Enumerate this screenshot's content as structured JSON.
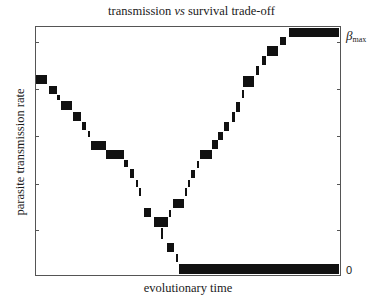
{
  "chart_data": {
    "type": "scatter",
    "title": "transmission vs survival trade-off",
    "title_parts": {
      "pre": "transmission ",
      "italic": "vs",
      "post": " survival trade-off"
    },
    "xlabel": "evolutionary time",
    "ylabel": "parasite transmission rate",
    "right_axis_labels": {
      "top": "β",
      "top_sub": "max",
      "bottom": "0"
    },
    "xlim": [
      0,
      1
    ],
    "ylim": [
      0,
      1
    ],
    "grid": false,
    "legend": null,
    "y_ticks_frac_from_top": [
      0.06,
      0.252,
      0.44,
      0.632,
      0.82
    ],
    "series": [
      {
        "name": "declining-branch",
        "blocks": [
          {
            "x0": 0.0,
            "x1": 0.036,
            "y0": 0.192,
            "y1": 0.228
          },
          {
            "x0": 0.042,
            "x1": 0.069,
            "y0": 0.236,
            "y1": 0.272
          },
          {
            "x0": 0.069,
            "x1": 0.078,
            "y0": 0.276,
            "y1": 0.296
          },
          {
            "x0": 0.082,
            "x1": 0.118,
            "y0": 0.3,
            "y1": 0.336
          },
          {
            "x0": 0.121,
            "x1": 0.147,
            "y0": 0.344,
            "y1": 0.38
          },
          {
            "x0": 0.151,
            "x1": 0.163,
            "y0": 0.384,
            "y1": 0.416
          },
          {
            "x0": 0.17,
            "x1": 0.175,
            "y0": 0.42,
            "y1": 0.444
          },
          {
            "x0": 0.18,
            "x1": 0.229,
            "y0": 0.46,
            "y1": 0.496
          },
          {
            "x0": 0.229,
            "x1": 0.288,
            "y0": 0.496,
            "y1": 0.532
          },
          {
            "x0": 0.291,
            "x1": 0.304,
            "y0": 0.536,
            "y1": 0.564
          },
          {
            "x0": 0.31,
            "x1": 0.324,
            "y0": 0.572,
            "y1": 0.608
          },
          {
            "x0": 0.33,
            "x1": 0.337,
            "y0": 0.616,
            "y1": 0.644
          },
          {
            "x0": 0.34,
            "x1": 0.346,
            "y0": 0.648,
            "y1": 0.68
          },
          {
            "x0": 0.356,
            "x1": 0.379,
            "y0": 0.728,
            "y1": 0.768
          },
          {
            "x0": 0.389,
            "x1": 0.435,
            "y0": 0.768,
            "y1": 0.808
          },
          {
            "x0": 0.412,
            "x1": 0.418,
            "y0": 0.812,
            "y1": 0.856
          },
          {
            "x0": 0.431,
            "x1": 0.454,
            "y0": 0.872,
            "y1": 0.908
          },
          {
            "x0": 0.461,
            "x1": 0.467,
            "y0": 0.916,
            "y1": 0.948
          },
          {
            "x0": 0.471,
            "x1": 0.997,
            "y0": 0.956,
            "y1": 0.996
          }
        ]
      },
      {
        "name": "rising-branch",
        "blocks": [
          {
            "x0": 0.438,
            "x1": 0.444,
            "y0": 0.736,
            "y1": 0.768
          },
          {
            "x0": 0.451,
            "x1": 0.487,
            "y0": 0.692,
            "y1": 0.728
          },
          {
            "x0": 0.49,
            "x1": 0.497,
            "y0": 0.648,
            "y1": 0.68
          },
          {
            "x0": 0.5,
            "x1": 0.507,
            "y0": 0.616,
            "y1": 0.644
          },
          {
            "x0": 0.51,
            "x1": 0.523,
            "y0": 0.576,
            "y1": 0.608
          },
          {
            "x0": 0.529,
            "x1": 0.536,
            "y0": 0.54,
            "y1": 0.568
          },
          {
            "x0": 0.539,
            "x1": 0.578,
            "y0": 0.496,
            "y1": 0.532
          },
          {
            "x0": 0.578,
            "x1": 0.598,
            "y0": 0.456,
            "y1": 0.492
          },
          {
            "x0": 0.598,
            "x1": 0.614,
            "y0": 0.424,
            "y1": 0.456
          },
          {
            "x0": 0.618,
            "x1": 0.634,
            "y0": 0.384,
            "y1": 0.42
          },
          {
            "x0": 0.644,
            "x1": 0.654,
            "y0": 0.344,
            "y1": 0.384
          },
          {
            "x0": 0.657,
            "x1": 0.67,
            "y0": 0.304,
            "y1": 0.344
          },
          {
            "x0": 0.676,
            "x1": 0.683,
            "y0": 0.256,
            "y1": 0.288
          },
          {
            "x0": 0.68,
            "x1": 0.716,
            "y0": 0.196,
            "y1": 0.24
          },
          {
            "x0": 0.725,
            "x1": 0.735,
            "y0": 0.156,
            "y1": 0.192
          },
          {
            "x0": 0.742,
            "x1": 0.755,
            "y0": 0.116,
            "y1": 0.152
          },
          {
            "x0": 0.761,
            "x1": 0.797,
            "y0": 0.076,
            "y1": 0.116
          },
          {
            "x0": 0.804,
            "x1": 0.824,
            "y0": 0.04,
            "y1": 0.072
          },
          {
            "x0": 0.833,
            "x1": 0.997,
            "y0": 0.004,
            "y1": 0.04
          }
        ]
      }
    ]
  }
}
